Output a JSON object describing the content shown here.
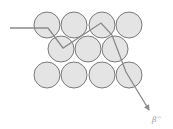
{
  "diagram": {
    "type": "particle-scattering",
    "label": "β⁻",
    "label_base": "β",
    "label_sup": "−",
    "colors": {
      "atom_fill": "#e4e4e4",
      "atom_stroke": "#7a7a7a",
      "path": "#8a8a8a",
      "label": "#9a9a9a"
    },
    "atoms": [
      {
        "row": 1,
        "cx": 47,
        "cy": 25
      },
      {
        "row": 1,
        "cx": 74,
        "cy": 25
      },
      {
        "row": 1,
        "cx": 102,
        "cy": 25
      },
      {
        "row": 1,
        "cx": 129,
        "cy": 25
      },
      {
        "row": 2,
        "cx": 61,
        "cy": 49
      },
      {
        "row": 2,
        "cx": 88,
        "cy": 49
      },
      {
        "row": 2,
        "cx": 115,
        "cy": 49
      },
      {
        "row": 3,
        "cx": 47,
        "cy": 75
      },
      {
        "row": 3,
        "cx": 74,
        "cy": 75
      },
      {
        "row": 3,
        "cx": 102,
        "cy": 75
      },
      {
        "row": 3,
        "cx": 129,
        "cy": 75
      }
    ],
    "atom_radius": 13,
    "particle_path": [
      [
        10,
        28
      ],
      [
        48,
        28
      ],
      [
        63,
        48
      ],
      [
        101,
        23
      ],
      [
        112,
        35
      ],
      [
        126,
        72
      ],
      [
        149,
        110
      ]
    ]
  }
}
